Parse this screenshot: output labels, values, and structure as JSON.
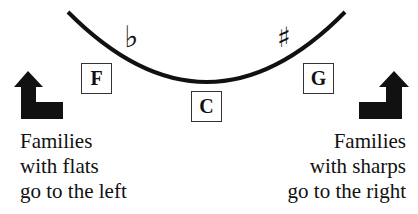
{
  "diagram": {
    "type": "circle-of-fifths-excerpt",
    "arc_color": "#111111",
    "accidentals": {
      "flat": {
        "symbol": "♭",
        "side": "left"
      },
      "sharp": {
        "symbol": "♯",
        "side": "right"
      }
    },
    "keys": [
      {
        "id": "F",
        "label": "F",
        "position": "left"
      },
      {
        "id": "C",
        "label": "C",
        "position": "center"
      },
      {
        "id": "G",
        "label": "G",
        "position": "right"
      }
    ],
    "arrows": {
      "left": {
        "direction": "up-left",
        "icon": "bent-arrow-up-icon"
      },
      "right": {
        "direction": "up-right",
        "icon": "bent-arrow-up-icon"
      }
    },
    "captions": {
      "left": {
        "lines": [
          "Families",
          "with flats",
          "go to the left"
        ]
      },
      "right": {
        "lines": [
          "Families",
          "with sharps",
          "go to the right"
        ]
      }
    }
  }
}
